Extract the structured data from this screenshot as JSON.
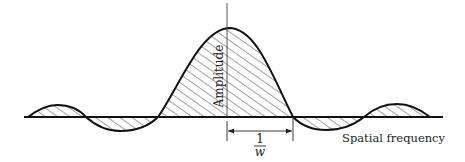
{
  "diagram": {
    "type": "sinc-like spatial frequency response",
    "labels": {
      "y_axis": "Amplitude",
      "x_axis": "Spatial frequency",
      "dimension_numerator": "1",
      "dimension_denominator": "w"
    },
    "colors": {
      "stroke": "#111111",
      "hatch": "#333333",
      "background": "#ffffff"
    },
    "geometry": {
      "baseline_y": 117,
      "baseline_x_start": 24,
      "baseline_x_end": 443,
      "axis_x": 227,
      "axis_y_top": 3,
      "peak": [
        229,
        28
      ],
      "zero_crossings_x": [
        28,
        86,
        158,
        293,
        364,
        430
      ],
      "dimension_span_x": [
        227,
        293
      ],
      "dimension_y": 131
    },
    "lobes": [
      {
        "name": "left-positive-side-lobe",
        "sign": "positive",
        "x_range": [
          28,
          86
        ],
        "extreme_y": 106
      },
      {
        "name": "left-negative-side-lobe",
        "sign": "negative",
        "x_range": [
          86,
          158
        ],
        "extreme_y": 131
      },
      {
        "name": "main-lobe",
        "sign": "positive",
        "x_range": [
          158,
          293
        ],
        "extreme_y": 28
      },
      {
        "name": "right-negative-side-lobe",
        "sign": "negative",
        "x_range": [
          293,
          364
        ],
        "extreme_y": 130
      },
      {
        "name": "right-positive-side-lobe",
        "sign": "positive",
        "x_range": [
          364,
          430
        ],
        "extreme_y": 105
      }
    ]
  }
}
